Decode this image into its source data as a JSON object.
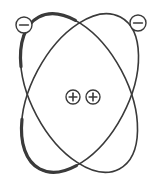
{
  "diagram": {
    "colors": {
      "stroke": "#3a3a3a",
      "background": "#ffffff",
      "particle_fill": "#ffffff"
    },
    "orbits": [
      {
        "name": "orbit-left-tilted",
        "cx": 79,
        "cy": 93,
        "rx": 48,
        "ry": 86,
        "rotate": -28
      },
      {
        "name": "orbit-right-tilted",
        "cx": 80,
        "cy": 93,
        "rx": 48,
        "ry": 86,
        "rotate": 28
      }
    ],
    "electrons": [
      {
        "name": "electron-left",
        "cx": 24,
        "cy": 25,
        "r": 8,
        "symbol": "−"
      },
      {
        "name": "electron-right",
        "cx": 138,
        "cy": 23,
        "r": 8,
        "symbol": "−"
      }
    ],
    "nucleus": [
      {
        "name": "proton-left",
        "cx": 73,
        "cy": 97,
        "r": 7,
        "symbol": "+"
      },
      {
        "name": "proton-right",
        "cx": 93,
        "cy": 97,
        "r": 7,
        "symbol": "+"
      }
    ]
  }
}
